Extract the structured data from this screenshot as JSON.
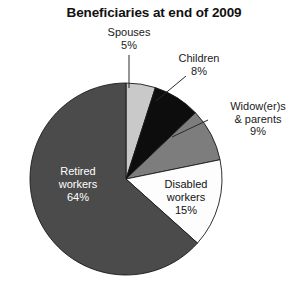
{
  "chart_data": {
    "type": "pie",
    "title": "Beneficiaries at end of 2009",
    "xlabel": "",
    "ylabel": "",
    "legend_position": "none",
    "grid": false,
    "start_angle_deg": 0,
    "direction": "clockwise",
    "categories": [
      "Spouses",
      "Children",
      "Widow(er)s & parents",
      "Disabled workers",
      "Retired workers"
    ],
    "values": [
      5,
      8,
      9,
      15,
      64
    ],
    "value_unit": "%",
    "slices": [
      {
        "name": "Spouses",
        "label_line1": "Spouses",
        "label_line2": "5%",
        "value": 5,
        "value_text": "5%",
        "color": "#c9c9c9",
        "label_placement": "outside",
        "leader": "vertical"
      },
      {
        "name": "Children",
        "label_line1": "Children",
        "label_line2": "8%",
        "value": 8,
        "value_text": "8%",
        "color": "#0d0d0d",
        "label_placement": "outside",
        "leader": "diagonal"
      },
      {
        "name": "Widow(er)s & parents",
        "label_line1": "Widow(er)s",
        "label_line2": "& parents",
        "label_line3": "9%",
        "value": 9,
        "value_text": "9%",
        "color": "#7d7d7d",
        "label_placement": "outside",
        "leader": "horizontal"
      },
      {
        "name": "Disabled workers",
        "label_line1": "Disabled",
        "label_line2": "workers",
        "label_line3": "15%",
        "value": 15,
        "value_text": "15%",
        "color": "#fdfdfd",
        "label_placement": "inside",
        "leader": "none"
      },
      {
        "name": "Retired workers",
        "label_line1": "Retired",
        "label_line2": "workers",
        "label_line3": "64%",
        "value": 64,
        "value_text": "64%",
        "color": "#4b4b4b",
        "label_placement": "inside",
        "leader": "none"
      }
    ]
  },
  "footer": {
    "cut_off_text": ""
  }
}
